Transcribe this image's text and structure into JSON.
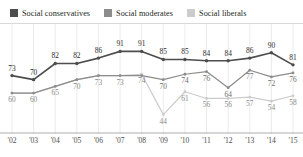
{
  "legend": {
    "items": [
      {
        "label": "Social conservatives",
        "color": "#4d4d4d",
        "key": "conservatives"
      },
      {
        "label": "Social moderates",
        "color": "#8c8c8c",
        "key": "moderates"
      },
      {
        "label": "Social liberals",
        "color": "#cccccc",
        "key": "liberals"
      }
    ]
  },
  "chart_data": {
    "type": "line",
    "title": "",
    "subtitle": "",
    "xlabel": "",
    "ylabel": "",
    "grid": "vertical",
    "legend_position": "top-left",
    "ylim": [
      40,
      95
    ],
    "categories": [
      "'02",
      "'03",
      "'04",
      "'05",
      "'06",
      "'07",
      "'08",
      "'09",
      "'10",
      "'11",
      "'12",
      "'13",
      "'14",
      "'15"
    ],
    "series": [
      {
        "name": "Social conservatives",
        "color": "#4d4d4d",
        "values": [
          73,
          70,
          82,
          82,
          86,
          91,
          91,
          85,
          85,
          84,
          84,
          86,
          90,
          81
        ]
      },
      {
        "name": "Social moderates",
        "color": "#8c8c8c",
        "values": [
          60,
          60,
          65,
          70,
          73,
          73,
          73,
          70,
          74,
          76,
          64,
          77,
          72,
          75
        ]
      },
      {
        "name": "Social liberals",
        "color": "#cccccc",
        "values": [
          60,
          60,
          65,
          70,
          73,
          73,
          74,
          44,
          61,
          56,
          56,
          57,
          54,
          58
        ]
      }
    ],
    "point_labels": {
      "conservatives": [
        "73",
        "70",
        "82",
        "82",
        "86",
        "91",
        "91",
        "85",
        "85",
        "84",
        "84",
        "86",
        "90",
        "81"
      ],
      "moderates": [
        "",
        "",
        "",
        "",
        "",
        "",
        "",
        "70",
        "74",
        "76",
        "64",
        "77",
        "72",
        "76"
      ],
      "liberals": [
        "60",
        "60",
        "65",
        "70",
        "73",
        "73",
        "74",
        "44",
        "61",
        "56",
        "56",
        "57",
        "54",
        "58"
      ]
    }
  }
}
